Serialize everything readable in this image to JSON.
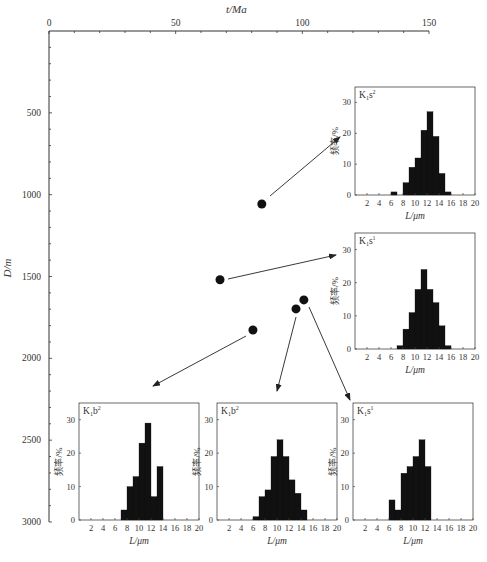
{
  "chart_data": {
    "type": "scatter",
    "title": "",
    "xlabel": "t/Ma",
    "ylabel": "D/m",
    "xlim": [
      0,
      150
    ],
    "ylim": [
      0,
      3000
    ],
    "y_inverted": true,
    "x_axis_position": "top",
    "x_ticks": [
      0,
      50,
      100,
      150
    ],
    "y_ticks": [
      500,
      1000,
      1500,
      2000,
      2500,
      3000
    ],
    "points": [
      {
        "t": 84,
        "D": 1057,
        "linked_histogram": "K1s2_top"
      },
      {
        "t": 67.5,
        "D": 1520,
        "linked_histogram": "K1s1_mid"
      },
      {
        "t": 100.6,
        "D": 1643,
        "linked_histogram": "K1s1_bottom"
      },
      {
        "t": 97.5,
        "D": 1698,
        "linked_histogram": "K1b2_center"
      },
      {
        "t": 80.5,
        "D": 1827,
        "linked_histogram": "K1b2_left"
      }
    ],
    "histograms": [
      {
        "id": "K1s2_top",
        "label": "K1s2",
        "base": "K",
        "sub": "1",
        "letter": "s",
        "sup": "2",
        "xlabel": "L/μm",
        "ylabel": "频率/%",
        "xlim": [
          0,
          20
        ],
        "ylim": [
          0,
          35
        ],
        "x_ticks": [
          2,
          4,
          6,
          8,
          10,
          12,
          14,
          16,
          18,
          20
        ],
        "y_ticks": [
          0,
          10,
          20,
          30
        ],
        "bins": [
          [
            6,
            7,
            1
          ],
          [
            8,
            9,
            4
          ],
          [
            9,
            10,
            9
          ],
          [
            10,
            11,
            12
          ],
          [
            11,
            12,
            21
          ],
          [
            12,
            13,
            27
          ],
          [
            13,
            14,
            19
          ],
          [
            14,
            15,
            7
          ],
          [
            15,
            16,
            1
          ]
        ]
      },
      {
        "id": "K1s1_mid",
        "label": "K1s1",
        "base": "K",
        "sub": "1",
        "letter": "s",
        "sup": "1",
        "xlabel": "L/μm",
        "ylabel": "频率/%",
        "xlim": [
          0,
          20
        ],
        "ylim": [
          0,
          35
        ],
        "x_ticks": [
          2,
          4,
          6,
          8,
          10,
          12,
          14,
          16,
          18,
          20
        ],
        "y_ticks": [
          0,
          10,
          20,
          30
        ],
        "bins": [
          [
            7,
            8,
            1
          ],
          [
            8,
            9,
            6
          ],
          [
            9,
            10,
            11
          ],
          [
            10,
            11,
            18
          ],
          [
            11,
            12,
            24
          ],
          [
            12,
            13,
            18
          ],
          [
            13,
            14,
            14
          ],
          [
            14,
            15,
            7
          ],
          [
            15,
            16,
            1
          ]
        ]
      },
      {
        "id": "K1b2_left",
        "label": "K1b2",
        "base": "K",
        "sub": "1",
        "letter": "b",
        "sup": "2",
        "xlabel": "L/μm",
        "ylabel": "频率/%",
        "xlim": [
          0,
          20
        ],
        "ylim": [
          0,
          35
        ],
        "x_ticks": [
          2,
          4,
          6,
          8,
          10,
          12,
          14,
          16,
          18,
          20
        ],
        "y_ticks": [
          0,
          10,
          20,
          30
        ],
        "bins": [
          [
            7,
            8,
            3
          ],
          [
            8,
            9,
            10
          ],
          [
            9,
            10,
            13
          ],
          [
            10,
            11,
            23
          ],
          [
            11,
            12,
            29
          ],
          [
            12,
            13,
            7
          ],
          [
            13,
            14,
            16
          ]
        ]
      },
      {
        "id": "K1b2_center",
        "label": "K1b2",
        "base": "K",
        "sub": "1",
        "letter": "b",
        "sup": "2",
        "xlabel": "L/μm",
        "ylabel": "频率/%",
        "xlim": [
          0,
          20
        ],
        "ylim": [
          0,
          35
        ],
        "x_ticks": [
          2,
          4,
          6,
          8,
          10,
          12,
          14,
          16,
          18,
          20
        ],
        "y_ticks": [
          0,
          10,
          20,
          30
        ],
        "bins": [
          [
            6,
            7,
            1
          ],
          [
            7,
            8,
            7
          ],
          [
            8,
            9,
            9
          ],
          [
            9,
            10,
            19
          ],
          [
            10,
            11,
            24
          ],
          [
            11,
            12,
            19
          ],
          [
            12,
            13,
            12
          ],
          [
            13,
            14,
            8
          ],
          [
            14,
            15,
            3
          ]
        ]
      },
      {
        "id": "K1s1_bottom",
        "label": "K1s1",
        "base": "K",
        "sub": "1",
        "letter": "s",
        "sup": "1",
        "xlabel": "L/μm",
        "ylabel": "频率/%",
        "xlim": [
          0,
          20
        ],
        "ylim": [
          0,
          35
        ],
        "x_ticks": [
          2,
          4,
          6,
          8,
          10,
          12,
          14,
          16,
          18,
          20
        ],
        "y_ticks": [
          0,
          10,
          20,
          30
        ],
        "bins": [
          [
            6,
            7,
            6
          ],
          [
            7,
            8,
            3
          ],
          [
            8,
            9,
            14
          ],
          [
            9,
            10,
            16
          ],
          [
            10,
            11,
            19
          ],
          [
            11,
            12,
            24
          ],
          [
            12,
            13,
            16
          ]
        ]
      }
    ]
  },
  "labels": {
    "x_axis_title": "t/Ma",
    "y_axis_title": "D/m",
    "hist_xlabel": "L/μm",
    "hist_ylabel": "频率/%"
  }
}
